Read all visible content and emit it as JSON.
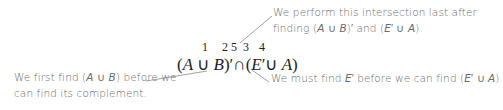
{
  "diagram": {
    "expression": {
      "parts": [
        "(",
        "A",
        " ∪ ",
        "B",
        ")′",
        "∩",
        "(",
        "E",
        "′∪ ",
        "A",
        ")"
      ],
      "order_labels": [
        "1",
        "2",
        "5",
        "3",
        "4"
      ]
    },
    "annotations": {
      "top": {
        "line1": "We perform this intersection last after",
        "line2_prefix": "finding (",
        "line2_a": "A",
        "line2_union1": " ∪ ",
        "line2_b": "B",
        "line2_mid": ")′ and (",
        "line2_e": "E",
        "line2_union2": "′ ∪ ",
        "line2_a2": "A",
        "line2_end": ")."
      },
      "bottom_left": {
        "line1_prefix": "We first find (",
        "line1_a": "A",
        "line1_union": " ∪ ",
        "line1_b": "B",
        "line1_suffix": ") before we",
        "line2": "can find its complement."
      },
      "bottom_right": {
        "prefix": "We must find ",
        "e": "E",
        "mid": "′ before we can find (",
        "e2": "E",
        "union": "′ ∪ ",
        "a": "A",
        "end": ")."
      }
    },
    "colors": {
      "annotation_text": "#6b6b6b",
      "leader_line": "#8a8a8a",
      "expression": "#1e1e1e"
    }
  }
}
